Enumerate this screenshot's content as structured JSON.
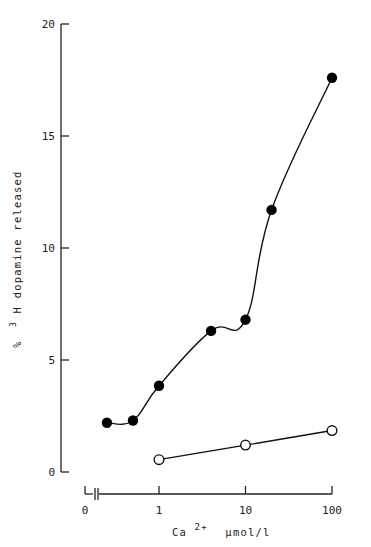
{
  "chart_data": {
    "type": "line",
    "title": "",
    "xlabel": "Ca2+ µmol/l",
    "xlabel_parts": {
      "base": "Ca",
      "sup": "2+",
      "unit": "µmol/l"
    },
    "ylabel": "% 3H dopamine released",
    "ylabel_parts": {
      "prefix": "%",
      "sup": "3",
      "rest": "H dopamine released"
    },
    "x_scale": "log",
    "x_axis_break": true,
    "x_ticks": [
      {
        "value": 0,
        "label": "0"
      },
      {
        "value": 1,
        "label": "1"
      },
      {
        "value": 10,
        "label": "10"
      },
      {
        "value": 100,
        "label": "100"
      }
    ],
    "y_ticks": [
      {
        "value": 0,
        "label": "0"
      },
      {
        "value": 5,
        "label": "5"
      },
      {
        "value": 10,
        "label": "10"
      },
      {
        "value": 15,
        "label": "15"
      },
      {
        "value": 20,
        "label": "20"
      }
    ],
    "ylim": [
      0,
      20
    ],
    "xlim": [
      0.2,
      100
    ],
    "grid": false,
    "legend": "none",
    "series": [
      {
        "name": "filled circles",
        "marker": "filled-circle",
        "smooth": true,
        "x": [
          0.25,
          0.5,
          1,
          4,
          10,
          20,
          100
        ],
        "values": [
          2.2,
          2.3,
          3.85,
          6.3,
          6.8,
          11.7,
          17.6
        ]
      },
      {
        "name": "open circles",
        "marker": "open-circle",
        "smooth": false,
        "x": [
          1,
          10,
          100
        ],
        "values": [
          0.55,
          1.2,
          1.85
        ]
      }
    ]
  }
}
